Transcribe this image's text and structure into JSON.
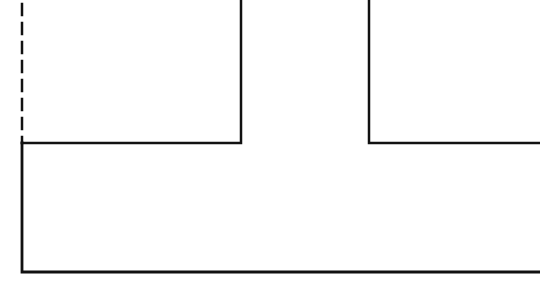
{
  "diagram": {
    "type": "line-drawing",
    "colors": {
      "background": "#ffffff",
      "line": "#111111"
    },
    "stroke_width": 2.5,
    "shapes": {
      "dashed_left_edge": {
        "kind": "dashed-line",
        "x": 22,
        "y1": 0,
        "y2": 143,
        "dash": "11 8"
      },
      "base_outline": {
        "kind": "polyline",
        "points": "22,143 22,272 540,272"
      },
      "top_left_segment": {
        "kind": "polyline",
        "points": "22,143 241,143 241,0"
      },
      "top_right_segment": {
        "kind": "polyline",
        "points": "369,0 369,143 540,143"
      }
    }
  }
}
